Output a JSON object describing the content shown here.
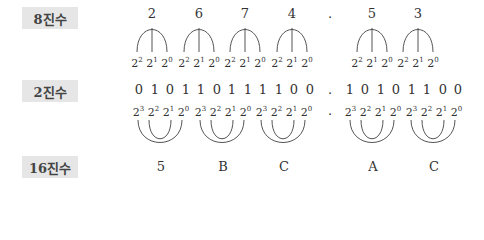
{
  "labels": {
    "octal": "8진수",
    "binary": "2진수",
    "hex": "16진수"
  },
  "octal": {
    "integer_digits": [
      "2",
      "6",
      "7",
      "4"
    ],
    "fraction_digits": [
      "5",
      "3"
    ],
    "point": ".",
    "weights": [
      "2²",
      "2¹",
      "2⁰"
    ]
  },
  "binary": {
    "integer_bits": [
      "0",
      "1",
      "0",
      "1",
      "1",
      "0",
      "1",
      "1",
      "1",
      "1",
      "0",
      "0"
    ],
    "fraction_bits": [
      "1",
      "0",
      "1",
      "0",
      "1",
      "1",
      "0",
      "0"
    ],
    "point": "."
  },
  "hex": {
    "integer_digits": [
      "5",
      "B",
      "C"
    ],
    "fraction_digits": [
      "A",
      "C"
    ],
    "point": ".",
    "weights": [
      "2³",
      "2²",
      "2¹",
      "2⁰"
    ]
  },
  "colors": {
    "label_bg": "#e6e6e6",
    "text": "#333333",
    "lines": "#555555"
  }
}
